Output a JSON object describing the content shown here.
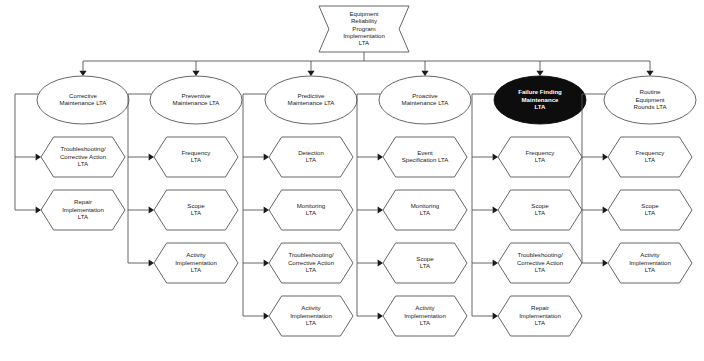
{
  "diagram": {
    "root": {
      "id": "root",
      "label_lines": [
        "Equipment",
        "Reliability",
        "Program",
        "Implementation",
        "LTA"
      ],
      "shape": "bowtie",
      "highlighted": false
    },
    "colors": {
      "background": "#ffffff",
      "node_fill": "#ffffff",
      "node_stroke": "#555555",
      "text": "#1a1a1a",
      "highlight_fill": "#0d0d0d",
      "highlight_text": "#ffffff",
      "connector": "#555555"
    },
    "branches": [
      {
        "id": "corrective",
        "label_lines": [
          "Corrective",
          "Maintenance LTA"
        ],
        "shape": "ellipse",
        "highlighted": false,
        "children": [
          {
            "id": "corrective-troubleshooting",
            "label_lines": [
              "Troubleshooting/",
              "Corrective Action",
              "LTA"
            ],
            "shape": "hexagon"
          },
          {
            "id": "corrective-repair",
            "label_lines": [
              "Repair",
              "Implementation",
              "LTA"
            ],
            "shape": "hexagon"
          }
        ]
      },
      {
        "id": "preventive",
        "label_lines": [
          "Preventive",
          "Maintenance LTA"
        ],
        "shape": "ellipse",
        "highlighted": false,
        "children": [
          {
            "id": "preventive-frequency",
            "label_lines": [
              "Frequency",
              "LTA"
            ],
            "shape": "hexagon"
          },
          {
            "id": "preventive-scope",
            "label_lines": [
              "Scope",
              "LTA"
            ],
            "shape": "hexagon"
          },
          {
            "id": "preventive-activity",
            "label_lines": [
              "Activity",
              "Implementation",
              "LTA"
            ],
            "shape": "hexagon"
          }
        ]
      },
      {
        "id": "predictive",
        "label_lines": [
          "Predictive",
          "Maintenance LTA"
        ],
        "shape": "ellipse",
        "highlighted": false,
        "children": [
          {
            "id": "predictive-detection",
            "label_lines": [
              "Detection",
              "LTA"
            ],
            "shape": "hexagon"
          },
          {
            "id": "predictive-monitoring",
            "label_lines": [
              "Monitoring",
              "LTA"
            ],
            "shape": "hexagon"
          },
          {
            "id": "predictive-troubleshooting",
            "label_lines": [
              "Troubleshooting/",
              "Corrective Action",
              "LTA"
            ],
            "shape": "hexagon"
          },
          {
            "id": "predictive-activity",
            "label_lines": [
              "Activity",
              "Implementation",
              "LTA"
            ],
            "shape": "hexagon"
          }
        ]
      },
      {
        "id": "proactive",
        "label_lines": [
          "Proactive",
          "Maintenance LTA"
        ],
        "shape": "ellipse",
        "highlighted": false,
        "children": [
          {
            "id": "proactive-event-spec",
            "label_lines": [
              "Event",
              "Specification LTA"
            ],
            "shape": "hexagon"
          },
          {
            "id": "proactive-monitoring",
            "label_lines": [
              "Monitoring",
              "LTA"
            ],
            "shape": "hexagon"
          },
          {
            "id": "proactive-scope",
            "label_lines": [
              "Scope",
              "LTA"
            ],
            "shape": "hexagon"
          },
          {
            "id": "proactive-activity",
            "label_lines": [
              "Activity",
              "Implementation",
              "LTA"
            ],
            "shape": "hexagon"
          }
        ]
      },
      {
        "id": "failure-finding",
        "label_lines": [
          "Failure Finding",
          "Maintenance",
          "LTA"
        ],
        "shape": "ellipse",
        "highlighted": true,
        "children": [
          {
            "id": "failure-finding-frequency",
            "label_lines": [
              "Frequency",
              "LTA"
            ],
            "shape": "hexagon"
          },
          {
            "id": "failure-finding-scope",
            "label_lines": [
              "Scope",
              "LTA"
            ],
            "shape": "hexagon"
          },
          {
            "id": "failure-finding-troubleshooting",
            "label_lines": [
              "Troubleshooting/",
              "Corrective Action",
              "LTA"
            ],
            "shape": "hexagon"
          },
          {
            "id": "failure-finding-repair",
            "label_lines": [
              "Repair",
              "Implementation",
              "LTA"
            ],
            "shape": "hexagon"
          }
        ]
      },
      {
        "id": "routine-rounds",
        "label_lines": [
          "Routine",
          "Equipment",
          "Rounds LTA"
        ],
        "shape": "ellipse",
        "highlighted": false,
        "children": [
          {
            "id": "routine-rounds-frequency",
            "label_lines": [
              "Frequency",
              "LTA"
            ],
            "shape": "hexagon"
          },
          {
            "id": "routine-rounds-scope",
            "label_lines": [
              "Scope",
              "LTA"
            ],
            "shape": "hexagon"
          },
          {
            "id": "routine-rounds-activity",
            "label_lines": [
              "Activity",
              "Implementation",
              "LTA"
            ],
            "shape": "hexagon"
          }
        ]
      }
    ]
  }
}
